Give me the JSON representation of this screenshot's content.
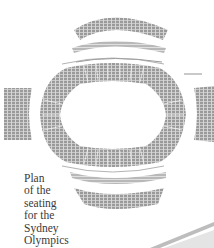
{
  "figure": {
    "caption_lines": [
      "Plan",
      "of the",
      "seating",
      "for the",
      "Sydney",
      "Olympics"
    ]
  },
  "colors": {
    "seating": "#8a8a8a",
    "seating_light": "#b5b5b5",
    "text": "#3a3a3a",
    "background": "#ffffff"
  }
}
